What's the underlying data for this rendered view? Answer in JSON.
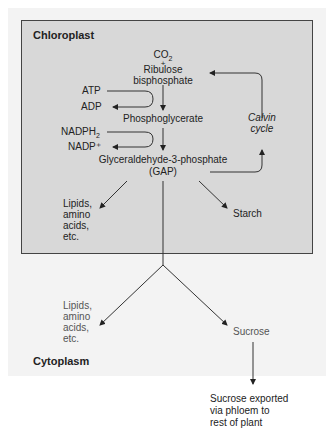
{
  "regions": {
    "chloroplast": "Chloroplast",
    "cytoplasm": "Cytoplasm"
  },
  "chloroplast_nodes": {
    "co2": "CO",
    "co2_sub": "2",
    "plus": "+",
    "rubp_line1": "Ribulose",
    "rubp_line2": "bisphosphate",
    "atp": "ATP",
    "adp": "ADP",
    "pga": "Phosphoglycerate",
    "nadph": "NADPH",
    "nadph_sub": "2",
    "nadp": "NADP⁺",
    "gap_line1": "Glyceraldehyde-3-phosphate",
    "gap_line2": "(GAP)",
    "calvin_line1": "Calvin",
    "calvin_line2": "cycle",
    "lipids": [
      "Lipids,",
      "amino",
      "acids,",
      "etc."
    ],
    "starch": "Starch"
  },
  "cytoplasm_nodes": {
    "lipids": [
      "Lipids,",
      "amino",
      "acids,",
      "etc."
    ],
    "sucrose": "Sucrose"
  },
  "export": [
    "Sucrose exported",
    "via  phloem to",
    "rest of plant"
  ]
}
